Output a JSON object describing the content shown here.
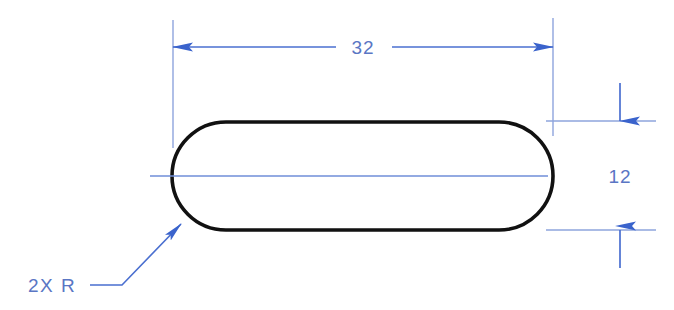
{
  "drawing": {
    "type": "engineering-dimensioned-sketch",
    "description": "Slot / stadium outline with linear dimensions",
    "canvas": {
      "width": 674,
      "height": 310,
      "background": "#ffffff"
    },
    "colors": {
      "dimension_blue": "#4a6fd0",
      "dimension_text_blue": "#5a76c4",
      "outline_black": "#111111",
      "centerline_blue": "#6f8ed8",
      "extension_blue": "#8ea4dd"
    },
    "part_outline": {
      "shape": "stadium",
      "left": 172,
      "right": 553,
      "top": 122,
      "bottom": 230,
      "stroke_width": 3.6
    },
    "dimensions": [
      {
        "name": "overall-length",
        "value": "32",
        "orientation": "horizontal",
        "line_y": 47,
        "arrow_left_x": 173,
        "arrow_right_x": 553,
        "label_x": 363,
        "label_y": 54
      },
      {
        "name": "overall-width",
        "value": "12",
        "orientation": "vertical",
        "line_x": 620,
        "arrow_top_y": 121,
        "arrow_bottom_y": 230,
        "label_x": 620,
        "label_y": 183
      }
    ],
    "notes": [
      {
        "name": "radius-note",
        "text": "2X  R",
        "label_x": 28,
        "label_y": 292,
        "leader_horizontal_y": 285,
        "leader_horizontal_from_x": 90,
        "leader_horizontal_to_x": 122,
        "leader_arrow_tip_x": 181,
        "leader_arrow_tip_y": 224
      }
    ],
    "centerline": {
      "name": "horizontal-centerline",
      "y": 176,
      "from_x": 150,
      "to_x": 548
    },
    "extension_lines": [
      {
        "name": "ext-left-vertical",
        "x1": 173,
        "y1": 20,
        "x2": 173,
        "y2": 148
      },
      {
        "name": "ext-right-vertical",
        "x1": 553,
        "y1": 18,
        "x2": 553,
        "y2": 136
      },
      {
        "name": "ext-top-horizontal",
        "x1": 546,
        "y1": 121,
        "x2": 656,
        "y2": 121
      },
      {
        "name": "ext-bottom-horizontal",
        "x1": 546,
        "y1": 230,
        "x2": 656,
        "y2": 230
      }
    ]
  },
  "labels": {
    "length": "32",
    "width": "12",
    "radius_note": "2X  R"
  }
}
